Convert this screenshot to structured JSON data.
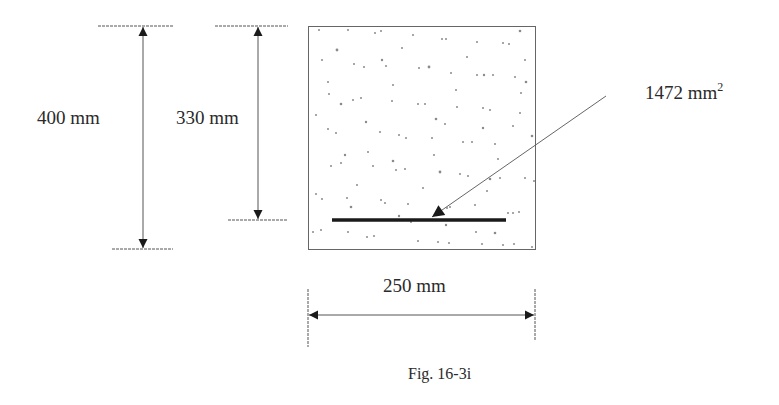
{
  "figure": {
    "caption": "Fig. 16-3i",
    "type": "reinforced concrete beam cross-section"
  },
  "dimensions": {
    "total_depth": {
      "value": "400 mm"
    },
    "effective_depth": {
      "value": "330 mm"
    },
    "width": {
      "value": "250 mm"
    }
  },
  "reinforcement": {
    "area_value": "1472 mm",
    "area_exponent": "2"
  },
  "colors": {
    "line": "#333333",
    "rebar": "#1a1a1a",
    "aggregate": "#777777",
    "dim_line": "#555555"
  }
}
